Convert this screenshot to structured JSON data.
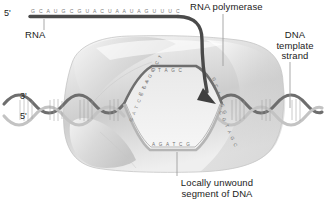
{
  "figure": {
    "width": 326,
    "height": 209,
    "background": "#ffffff"
  },
  "colors": {
    "ink": "#1b1b1b",
    "rna_strand": "#4a4a4a",
    "polymerase_light": "#f0f0f0",
    "polymerase_mid": "#cfcfcf",
    "polymerase_dark": "#a8a8a8",
    "dna_template": "#6e6e6e",
    "dna_coding": "#b8b8b8",
    "leader_line": "#9a9a9a",
    "base_text": "#6f6f6f"
  },
  "labels": {
    "rna": "RNA",
    "rna_polymerase": "RNA polymerase",
    "dna_template_strand": "DNA\ntemplate\nstrand",
    "locally_unwound": "Locally unwound\nsegment of DNA",
    "five_prime_top": "5'",
    "three_prime_left": "3'",
    "five_prime_left": "5'"
  },
  "sequences": {
    "rna_transcript": "G C A U G C G U A C U A A U A G U U U C",
    "bubble_template_upper": "C T A G C",
    "bubble_template_left": "C T A G G C T",
    "bubble_coding_lower": "A G A T C G",
    "bubble_coding_left": "G A T C C G A",
    "bubble_right_upper": "G C A T C G",
    "bubble_right_lower": "C G T A G C"
  },
  "icon_names": {
    "leader": "leader-line-icon",
    "arrowhead": "arrowhead-icon",
    "helix": "dna-helix-icon",
    "blob": "polymerase-blob-icon"
  }
}
